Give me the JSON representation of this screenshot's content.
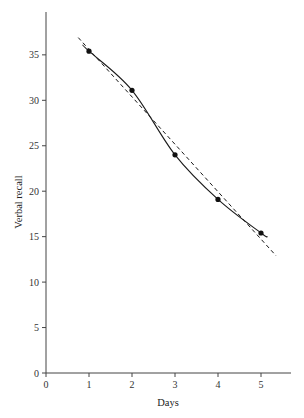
{
  "chart_data": {
    "type": "line",
    "title": "",
    "xlabel": "Days",
    "ylabel": "Verbal recall",
    "xlim": [
      0,
      5.6
    ],
    "ylim": [
      0,
      40
    ],
    "xticks": [
      0,
      1,
      2,
      3,
      4,
      5
    ],
    "yticks": [
      0,
      5,
      10,
      15,
      20,
      25,
      30,
      35
    ],
    "grid": false,
    "legend": null,
    "series": [
      {
        "name": "Observed",
        "style": "solid with markers",
        "x": [
          1,
          2,
          3,
          4,
          5
        ],
        "values": [
          35.4,
          31.1,
          24.0,
          19.1,
          15.4
        ]
      },
      {
        "name": "Linear fit",
        "style": "dashed",
        "x": [
          0.75,
          5.35
        ],
        "values": [
          36.9,
          12.9
        ]
      }
    ]
  },
  "axes": {
    "x_label": "Days",
    "y_label": "Verbal recall",
    "x_tick_labels": [
      "0",
      "1",
      "2",
      "3",
      "4",
      "5"
    ],
    "y_tick_labels": [
      "0",
      "5",
      "10",
      "15",
      "20",
      "25",
      "30",
      "35"
    ]
  },
  "colors": {
    "axis": "#444444",
    "line": "#1a1a1a",
    "marker": "#111111"
  }
}
